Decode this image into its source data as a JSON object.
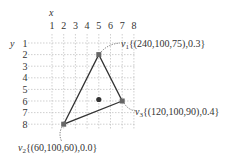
{
  "axes": {
    "x_label": "x",
    "y_label": "y",
    "x_ticks": [
      "1",
      "2",
      "3",
      "4",
      "5",
      "6",
      "7",
      "8"
    ],
    "y_ticks": [
      "1",
      "2",
      "3",
      "4",
      "5",
      "6",
      "7",
      "8"
    ]
  },
  "vertices": [
    {
      "id": "v1",
      "name": "v",
      "sub": "1",
      "grid": [
        5,
        2
      ],
      "label": "{(240,100,75),0.3}"
    },
    {
      "id": "v2",
      "name": "v",
      "sub": "2",
      "grid": [
        2,
        8
      ],
      "label": "{(60,100,60),0.0}"
    },
    {
      "id": "v3",
      "name": "v",
      "sub": "3",
      "grid": [
        7,
        6
      ],
      "label": "{(120,100,90),0.4}"
    }
  ],
  "interior_point": {
    "grid": [
      5,
      6
    ]
  },
  "colors": {
    "grid": "#bbbbbb",
    "edge": "#333333",
    "vertex": "#555555",
    "point": "#333333"
  }
}
